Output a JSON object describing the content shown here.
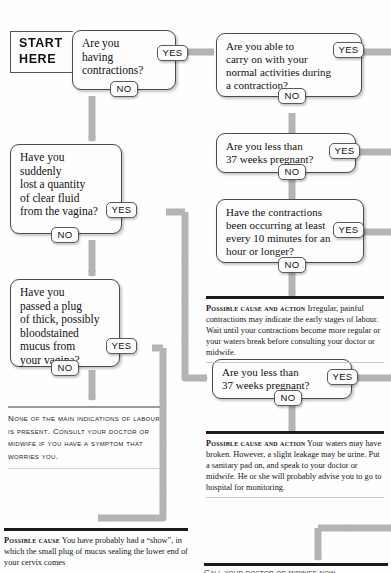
{
  "document": {
    "type": "medical-decision-flowchart",
    "topic": "Am I in labour?",
    "colors": {
      "connector": "#b3b3b3",
      "connector_dark": "#a0a0a0",
      "box_border": "#4a4a4a",
      "box_fill": "#fdfdfd",
      "rule_dark": "#1b1b1b",
      "rule_light": "#c9c9c9",
      "text": "#15151a"
    }
  },
  "start": {
    "line1": "START",
    "line2": "HERE"
  },
  "labels": {
    "yes": "YES",
    "no": "NO"
  },
  "questions": [
    {
      "id": "q1-contractions",
      "text": "Are you\nhaving\ncontractions?",
      "yes": "YES",
      "no": "NO"
    },
    {
      "id": "q2-carry-on",
      "text": "Are you able to\ncarry on with your\nnormal activities during\na contraction?",
      "yes": "YES",
      "no": "NO"
    },
    {
      "id": "q3-less-than-37-weeks-a",
      "text": "Are you less than\n37 weeks pregnant?",
      "yes": "YES",
      "no": "NO"
    },
    {
      "id": "q4-contraction-frequency",
      "text": "Have the contractions\nbeen occurring at least\nevery 10 minutes for an\nhour or longer?",
      "yes": "YES",
      "no": "NO"
    },
    {
      "id": "q5-clear-fluid",
      "text": "Have you\nsuddenly\nlost a quantity\nof clear fluid\nfrom the vagina?",
      "yes": "YES",
      "no": "NO"
    },
    {
      "id": "q6-less-than-37-weeks-b",
      "text": "Are you less than\n37 weeks pregnant?",
      "yes": "YES",
      "no": "NO"
    },
    {
      "id": "q7-mucus-plug",
      "text": "Have you\npassed a plug\nof thick, possibly\nbloodstained\nmucus from\nyour vagina?",
      "yes": "YES",
      "no": "NO"
    }
  ],
  "outcomes": [
    {
      "id": "outcome-irregular-contractions",
      "lead": "Possible cause and action",
      "body": "Irregular, painful contractions may indicate the early stages of labour. Wait until your contractions become more regular or your waters break before consulting your doctor or midwife."
    },
    {
      "id": "outcome-waters-broken",
      "lead": "Possible cause and action",
      "body": "Your waters may have broken. However, a slight leakage may be urine. Put a sanitary pad on, and speak to your doctor or midwife. He or she will probably advise you to go to hospital for monitoring."
    },
    {
      "id": "outcome-no-indications",
      "text": "None of the main indications of labour is present. Consult your doctor or midwife if you have a symptom that worries you."
    },
    {
      "id": "outcome-show",
      "lead": "Possible cause",
      "body": "You have probably had a “show”, in which the small plug of mucus sealing the lower end of your cervix comes"
    },
    {
      "id": "outcome-call-doctor-clipped",
      "text": "Call your doctor or midwife now"
    }
  ]
}
